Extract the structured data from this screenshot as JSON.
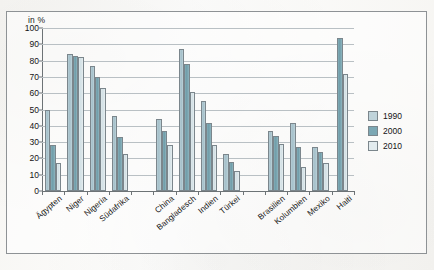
{
  "chart_data": {
    "type": "bar",
    "title": "",
    "xlabel": "",
    "ylabel": "in %",
    "ylim": [
      0,
      100
    ],
    "ytick_step": 10,
    "yticks": [
      0,
      10,
      20,
      30,
      40,
      50,
      60,
      70,
      80,
      90,
      100
    ],
    "grid": true,
    "legend_position": "right",
    "categories": [
      "Ägypten",
      "Niger",
      "Nigeria",
      "Südafrika",
      "China",
      "Bangladesch",
      "Indien",
      "Türkei",
      "Brasilien",
      "Kolumbien",
      "Mexiko",
      "Haiti"
    ],
    "group_breaks_after": [
      "Südafrika",
      "Türkei"
    ],
    "series": [
      {
        "name": "1990",
        "color": "#b0c8d1",
        "values": [
          50,
          84,
          77,
          46,
          null,
          null,
          null,
          null,
          null,
          null,
          null,
          null
        ]
      },
      {
        "name": "2000",
        "color": "#7ba7b3",
        "values": [
          28,
          83,
          70,
          33,
          44,
          87,
          55,
          23,
          31,
          42,
          24,
          94
        ]
      },
      {
        "name": "2010",
        "color": "#dce7ea",
        "values": [
          17,
          82,
          63,
          23,
          37,
          78,
          42,
          18,
          null,
          null,
          null,
          72
        ]
      }
    ],
    "series_extra_note": {
      "china_1990": 44,
      "bangladesch_1990": 87,
      "indien_1990": 55,
      "tuerkei_1990": 23
    },
    "groups": [
      {
        "category": "Ägypten",
        "values": {
          "1990": 50,
          "2000": 28,
          "2010": 17
        }
      },
      {
        "category": "Niger",
        "values": {
          "1990": 84,
          "2000": 83,
          "2010": 82
        }
      },
      {
        "category": "Nigeria",
        "values": {
          "1990": 77,
          "2000": 70,
          "2010": 63
        }
      },
      {
        "category": "Südafrika",
        "values": {
          "1990": 46,
          "2000": 33,
          "2010": 23
        }
      },
      {
        "category": "China",
        "values": {
          "1990": 44,
          "2000": 37,
          "2010": 28
        }
      },
      {
        "category": "Bangladesch",
        "values": {
          "1990": 87,
          "2000": 78,
          "2010": 61
        }
      },
      {
        "category": "Indien",
        "values": {
          "1990": 55,
          "2000": 42,
          "2010": 28
        }
      },
      {
        "category": "Türkei",
        "values": {
          "1990": 23,
          "2000": 18,
          "2010": 12
        }
      },
      {
        "category": "Brasilien",
        "values": {
          "1990": 37,
          "2000": 34,
          "2010": 29
        }
      },
      {
        "category": "Kolumbien",
        "values": {
          "1990": 42,
          "2000": 27,
          "2010": 15
        }
      },
      {
        "category": "Mexiko",
        "values": {
          "1990": 27,
          "2000": 24,
          "2010": 17
        }
      },
      {
        "category": "Haiti",
        "values": {
          "1990": null,
          "2000": 94,
          "2010": 72
        }
      }
    ]
  },
  "legend": {
    "items": [
      {
        "label": "1990",
        "swatch": "s1990"
      },
      {
        "label": "2000",
        "swatch": "s2000"
      },
      {
        "label": "2010",
        "swatch": "s2010"
      }
    ]
  },
  "axis": {
    "unit_label": "in %"
  }
}
